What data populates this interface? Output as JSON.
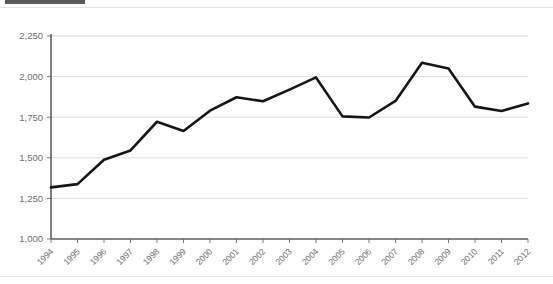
{
  "figure": {
    "background_color": "#fefefe",
    "scan_bar_color": "#59595b",
    "line_color": "#161616",
    "grid_color": "#d3d3d5",
    "axis_color": "#5e5e60",
    "tick_label_color": "#6e6e70"
  },
  "chart_data": {
    "type": "line",
    "title": "",
    "subtitle": "",
    "xlabel": "",
    "ylabel": "",
    "categories": [
      "1994",
      "1995",
      "1996",
      "1997",
      "1998",
      "1999",
      "2000",
      "2001",
      "2002",
      "2003",
      "2004",
      "2005",
      "2006",
      "2007",
      "2008",
      "2009",
      "2010",
      "2011",
      "2012"
    ],
    "values": [
      1318,
      1338,
      1488,
      1545,
      1722,
      1665,
      1790,
      1873,
      1848,
      1920,
      1995,
      1755,
      1748,
      1850,
      2085,
      2050,
      1815,
      1788,
      1835
    ],
    "series": [
      {
        "name": "series-1",
        "values": [
          1318,
          1338,
          1488,
          1545,
          1722,
          1665,
          1790,
          1873,
          1848,
          1920,
          1995,
          1755,
          1748,
          1850,
          2085,
          2050,
          1815,
          1788,
          1835
        ]
      }
    ],
    "ylim": [
      1000,
      2250
    ],
    "ytick_values": [
      1000,
      1250,
      1500,
      1750,
      2000,
      2250
    ],
    "ytick_labels": [
      "1,000",
      "1,250",
      "1,500",
      "1,750",
      "2,000",
      "2,250"
    ],
    "xtick_labels": [
      "1994",
      "1995",
      "1996",
      "1997",
      "1998",
      "1999",
      "2000",
      "2001",
      "2002",
      "2003",
      "2004",
      "2005",
      "2006",
      "2007",
      "2008",
      "2009",
      "2010",
      "2011",
      "2012"
    ],
    "grid": "horizontal",
    "legend": "none",
    "annotations": []
  }
}
